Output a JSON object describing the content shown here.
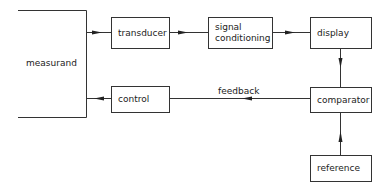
{
  "diagram": {
    "type": "block-diagram",
    "nodes": {
      "measurand": "measurand",
      "transducer": "transducer",
      "signal_conditioning_line1": "signal",
      "signal_conditioning_line2": "conditioning",
      "display": "display",
      "comparator": "comparator",
      "control": "control",
      "reference": "reference"
    },
    "edge_labels": {
      "feedback": "feedback"
    },
    "edges": [
      {
        "from": "measurand",
        "to": "transducer"
      },
      {
        "from": "transducer",
        "to": "signal conditioning"
      },
      {
        "from": "signal conditioning",
        "to": "display"
      },
      {
        "from": "display",
        "to": "comparator"
      },
      {
        "from": "reference",
        "to": "comparator"
      },
      {
        "from": "comparator",
        "to": "control",
        "label": "feedback"
      },
      {
        "from": "control",
        "to": "measurand"
      }
    ],
    "colors": {
      "line": "#333333",
      "background": "#ffffff"
    }
  }
}
